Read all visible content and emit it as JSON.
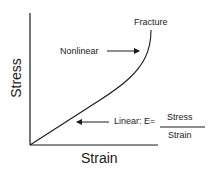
{
  "diagram": {
    "x_axis_label": "Strain",
    "y_axis_label": "Stress",
    "annotations": {
      "fracture": "Fracture",
      "nonlinear": "Nonlinear",
      "linear_prefix": "Linear: E=",
      "fraction_numerator": "Stress",
      "fraction_denominator": "Strain"
    },
    "colors": {
      "line": "#1a1a1a",
      "background": "#ffffff"
    }
  }
}
